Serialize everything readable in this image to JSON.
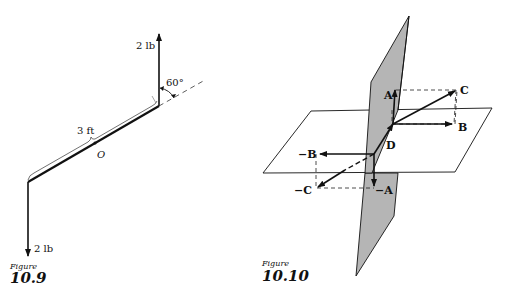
{
  "figure_10_9": {
    "caption_word": "Figure",
    "caption_number": "10.9",
    "force_top_label": "2 lb",
    "force_bottom_label": "2 lb",
    "length_label": "3 ft",
    "angle_label": "60°",
    "pivot_label": "O"
  },
  "figure_10_10": {
    "caption_word": "Figure",
    "caption_number": "10.10",
    "vectors": [
      {
        "label": "A"
      },
      {
        "label": "B"
      },
      {
        "label": "C"
      },
      {
        "label": "D"
      },
      {
        "label": "−A"
      },
      {
        "label": "−B"
      },
      {
        "label": "−C"
      }
    ],
    "colors": {
      "plane_fill": "#b5b5b5",
      "line": "#111111"
    }
  }
}
